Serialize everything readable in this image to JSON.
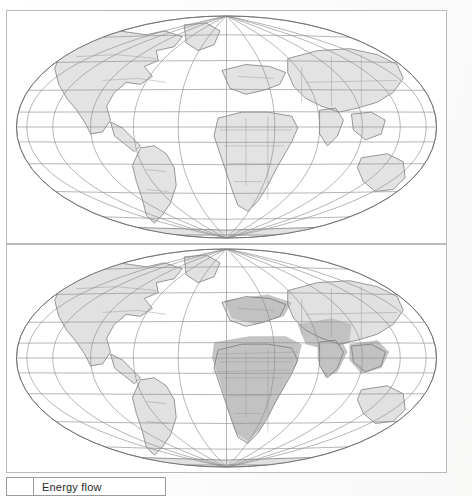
{
  "document": {
    "type": "scanned-figure",
    "panel_count": 2,
    "projection": "Mollweide elliptical world projection"
  },
  "panels": [
    {
      "id": "panel-top",
      "name": "world-map-energy-flow-upper",
      "caption": "",
      "shading_label": "lighter grey country shading",
      "graticule": {
        "meridian_step_deg": 30,
        "parallel_step_deg": 20,
        "meridians": [
          -180,
          -150,
          -120,
          -90,
          -60,
          -30,
          0,
          30,
          60,
          90,
          120,
          150,
          180
        ],
        "parallels": [
          -80,
          -60,
          -40,
          -20,
          0,
          20,
          40,
          60,
          80
        ]
      }
    },
    {
      "id": "panel-bottom",
      "name": "world-map-energy-flow-lower",
      "caption": "",
      "shading_label": "darker grey country shading",
      "graticule": {
        "meridian_step_deg": 30,
        "parallel_step_deg": 20,
        "meridians": [
          -180,
          -150,
          -120,
          -90,
          -60,
          -30,
          0,
          30,
          60,
          90,
          120,
          150,
          180
        ],
        "parallels": [
          -80,
          -60,
          -40,
          -20,
          0,
          20,
          40,
          60,
          80
        ]
      }
    }
  ],
  "legend": {
    "swatch_color": "#ffffff",
    "label": "Energy flow"
  },
  "colors": {
    "page_background": "#fdfdfd",
    "panel_border": "#b9b9bb",
    "graticule_line": "#8e8e92",
    "coastline": "#6e6e72",
    "country_border": "#9a9a9e",
    "shading_light": "#dcdcdc",
    "shading_dark": "#c2c2c2",
    "legend_border": "#9b9b9d",
    "legend_text": "#2a2a2a"
  }
}
